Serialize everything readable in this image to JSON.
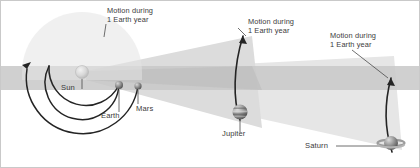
{
  "figure": {
    "background_color": "#ffffff",
    "border_color": "#c9c9c9",
    "band_color": "#cfcfcf",
    "wedge_color": "#d4d4d4",
    "wedge_color_light": "#e4e4e4",
    "orbit_line_color": "#2b2b2b",
    "label_color": "#3b3b3b",
    "leader_color": "#4a4a4a"
  },
  "annotations": [
    {
      "id": "motion-earth",
      "line1": "Motion during",
      "line2": "1 Earth year",
      "x": 107,
      "y": 7
    },
    {
      "id": "motion-jupiter",
      "line1": "Motion during",
      "line2": "1 Earth year",
      "x": 248,
      "y": 18
    },
    {
      "id": "motion-saturn",
      "line1": "Motion during",
      "line2": "1 Earth year",
      "x": 330,
      "y": 32
    }
  ],
  "bodies": [
    {
      "id": "sun",
      "label": "Sun",
      "label_x": 61,
      "label_y": 84,
      "cx": 82,
      "cy": 72,
      "r": 6.5,
      "color": "#cfcfcf",
      "type": "star"
    },
    {
      "id": "earth",
      "label": "Earth",
      "label_x": 101,
      "label_y": 112,
      "cx": 119,
      "cy": 85,
      "r": 4.0,
      "color": "#8f8f8f",
      "type": "planet"
    },
    {
      "id": "mars",
      "label": "Mars",
      "label_x": 136,
      "label_y": 105,
      "cx": 138,
      "cy": 86,
      "r": 3.6,
      "color": "#7e7e7e",
      "type": "planet"
    },
    {
      "id": "jupiter",
      "label": "Jupiter",
      "label_x": 222,
      "label_y": 130,
      "cx": 240,
      "cy": 112,
      "r": 7.5,
      "color": "#9a9a9a",
      "type": "planet-banded"
    },
    {
      "id": "saturn",
      "label": "Saturn",
      "label_x": 305,
      "label_y": 142,
      "cx": 391,
      "cy": 143,
      "r": 7.0,
      "color": "#8d8d8d",
      "type": "planet-ringed"
    }
  ],
  "orbit_arcs": [
    {
      "id": "earth-orbit-arc",
      "description": "Earth orbit full circle"
    },
    {
      "id": "mars-orbit-arc",
      "description": "Mars orbit arc with arrowhead"
    },
    {
      "id": "jupiter-orbit-arc",
      "description": "Jupiter short orbital arc with arrowhead"
    },
    {
      "id": "saturn-orbit-arc",
      "description": "Saturn short orbital arc with arrowhead"
    }
  ]
}
